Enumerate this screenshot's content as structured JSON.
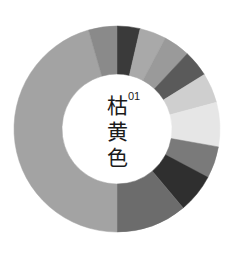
{
  "title": {
    "number": "01",
    "chars": [
      "枯",
      "黄",
      "色"
    ]
  },
  "ring": {
    "cx": 117,
    "cy": 129,
    "outer_r": 103,
    "inner_r": 55,
    "segments": [
      {
        "start": 0,
        "end": 13,
        "color": "#3a3a3a"
      },
      {
        "start": 13,
        "end": 28,
        "color": "#a9a9a9"
      },
      {
        "start": 28,
        "end": 43,
        "color": "#9a9a9a"
      },
      {
        "start": 43,
        "end": 58,
        "color": "#5a5a5a"
      },
      {
        "start": 58,
        "end": 75,
        "color": "#cfcfcf"
      },
      {
        "start": 75,
        "end": 100,
        "color": "#e6e6e6"
      },
      {
        "start": 100,
        "end": 118,
        "color": "#7a7a7a"
      },
      {
        "start": 118,
        "end": 140,
        "color": "#2f2f2f"
      },
      {
        "start": 140,
        "end": 180,
        "color": "#6c6c6c"
      },
      {
        "start": 180,
        "end": 344,
        "color": "#a3a3a3"
      },
      {
        "start": 344,
        "end": 360,
        "color": "#8a8a8a"
      }
    ]
  }
}
